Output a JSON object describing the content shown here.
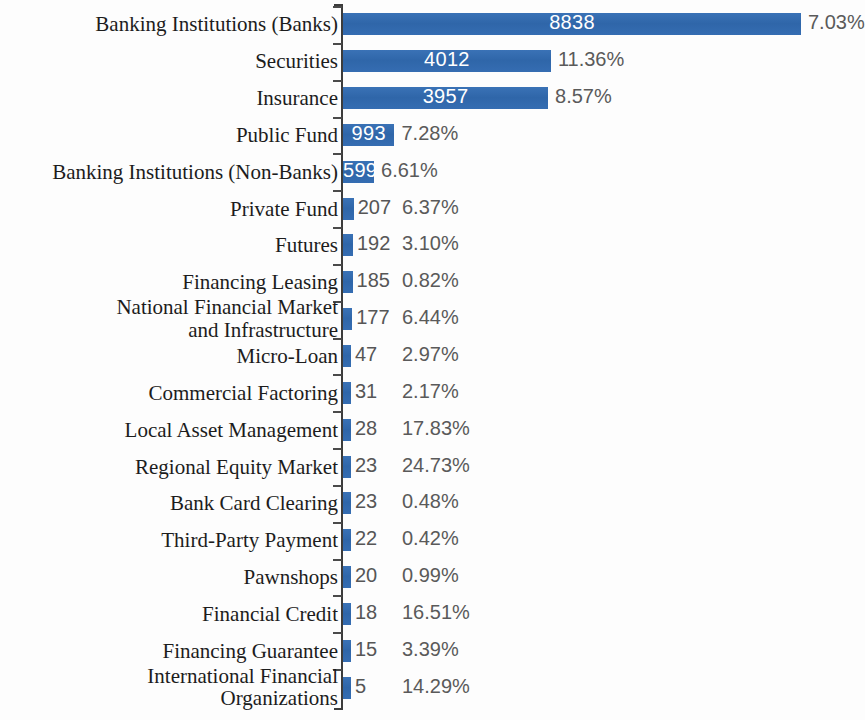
{
  "chart_data": {
    "type": "bar",
    "orientation": "horizontal",
    "title": "",
    "subtitle": "",
    "xlabel": "",
    "ylabel": "",
    "grid": false,
    "legend": null,
    "axis": {
      "x_range": [
        0,
        8838
      ],
      "value_axis": "horizontal",
      "category_axis_side": "left"
    },
    "series": [
      {
        "name": "Count",
        "values": [
          8838,
          4012,
          3957,
          993,
          599,
          207,
          192,
          185,
          177,
          47,
          31,
          28,
          23,
          23,
          22,
          20,
          18,
          15,
          5
        ]
      },
      {
        "name": "Percent",
        "values": [
          7.03,
          11.36,
          8.57,
          7.28,
          6.61,
          6.37,
          3.1,
          0.82,
          6.44,
          2.97,
          2.17,
          17.83,
          24.73,
          0.48,
          0.42,
          0.99,
          16.51,
          3.39,
          14.29
        ]
      }
    ],
    "categories": [
      "Banking Institutions (Banks)",
      "Securities",
      "Insurance",
      "Public Fund",
      "Banking Institutions (Non-Banks)",
      "Private Fund",
      "Futures",
      "Financing Leasing",
      "National Financial Market\nand Infrastructure",
      "Micro-Loan",
      "Commercial Factoring",
      "Local Asset Management",
      "Regional Equity Market",
      "Bank Card Clearing",
      "Third-Party Payment",
      "Pawnshops",
      "Financial Credit",
      "Financing Guarantee",
      "International Financial\nOrganizations"
    ],
    "bar_color": "#336aae",
    "value_label_inside_color": "#ffffff",
    "value_label_outside_color": "#565656",
    "percent_label_color": "#5a5a5a"
  },
  "rows": [
    {
      "label": "Banking Institutions (Banks)",
      "value": "8838",
      "percent": "7.03%",
      "inside": true
    },
    {
      "label": "Securities",
      "value": "4012",
      "percent": "11.36%",
      "inside": true
    },
    {
      "label": "Insurance",
      "value": "3957",
      "percent": "8.57%",
      "inside": true
    },
    {
      "label": "Public Fund",
      "value": "993",
      "percent": "7.28%",
      "inside": true
    },
    {
      "label": "Banking Institutions (Non-Banks)",
      "value": "599",
      "percent": "6.61%",
      "inside": true
    },
    {
      "label": "Private Fund",
      "value": "207",
      "percent": "6.37%",
      "inside": false
    },
    {
      "label": "Futures",
      "value": "192",
      "percent": "3.10%",
      "inside": false
    },
    {
      "label": "Financing Leasing",
      "value": "185",
      "percent": "0.82%",
      "inside": false
    },
    {
      "label": "National Financial Market\nand Infrastructure",
      "value": "177",
      "percent": "6.44%",
      "inside": false
    },
    {
      "label": "Micro-Loan",
      "value": "47",
      "percent": "2.97%",
      "inside": false
    },
    {
      "label": "Commercial Factoring",
      "value": "31",
      "percent": "2.17%",
      "inside": false
    },
    {
      "label": "Local Asset Management",
      "value": "28",
      "percent": "17.83%",
      "inside": false
    },
    {
      "label": "Regional Equity Market",
      "value": "23",
      "percent": "24.73%",
      "inside": false
    },
    {
      "label": "Bank Card Clearing",
      "value": "23",
      "percent": "0.48%",
      "inside": false
    },
    {
      "label": "Third-Party Payment",
      "value": "22",
      "percent": "0.42%",
      "inside": false
    },
    {
      "label": "Pawnshops",
      "value": "20",
      "percent": "0.99%",
      "inside": false
    },
    {
      "label": "Financial Credit",
      "value": "18",
      "percent": "16.51%",
      "inside": false
    },
    {
      "label": "Financing Guarantee",
      "value": "15",
      "percent": "3.39%",
      "inside": false
    },
    {
      "label": "International Financial\nOrganizations",
      "value": "5",
      "percent": "14.29%",
      "inside": false
    }
  ]
}
